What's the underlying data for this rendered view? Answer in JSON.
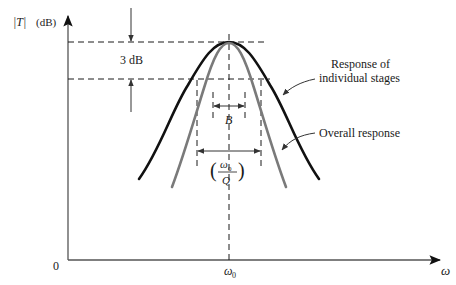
{
  "figure": {
    "type": "bandpass-frequency-response-diagram",
    "y_axis_label_magnitude": "|T|",
    "y_axis_label_unit": "(dB)",
    "x_axis_label": "ω",
    "origin_label": "0",
    "center_frequency_label": "ω",
    "center_frequency_subscript": "0",
    "three_db_label": "3 dB",
    "bandwidth_overall_label": "B",
    "bandwidth_stage_numerator": "ω",
    "bandwidth_stage_numerator_subscript": "0",
    "bandwidth_stage_denominator": "Q",
    "annotation_individual_line1": "Response of",
    "annotation_individual_line2": "individual stages",
    "annotation_overall": "Overall response"
  },
  "colors": {
    "individual_stage_curve": "#111111",
    "overall_response_curve": "#7a7a7a",
    "axis": "#555555",
    "text": "#1a1a1a"
  }
}
